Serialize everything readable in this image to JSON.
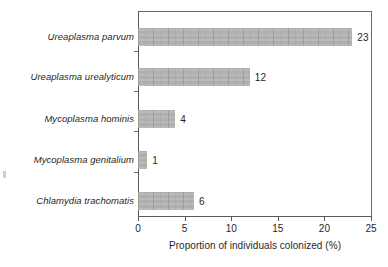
{
  "chart_data": {
    "type": "bar",
    "orientation": "horizontal",
    "title": "",
    "xlabel": "Proportion of individuals colonized (%)",
    "ylabel": "",
    "categories": [
      "Ureaplasma parvum",
      "Ureaplasma urealyticum",
      "Mycoplasma hominis",
      "Mycoplasma genitalium",
      "Chlamydia trachomatis"
    ],
    "values": [
      23,
      12,
      4,
      1,
      6
    ],
    "value_labels": [
      "23",
      "12",
      "4",
      "1",
      "6"
    ],
    "xlim": [
      0,
      25
    ],
    "xticks": [
      0,
      5,
      10,
      15,
      20,
      25
    ],
    "xtick_labels": [
      "0",
      "5",
      "10",
      "15",
      "20",
      "25"
    ],
    "grid": false,
    "legend": null,
    "bar_color": "#b2b2b2",
    "axis_color": "#5a5a5a",
    "text_color": "#1f1f1f"
  },
  "axis": {
    "x_title": "Proportion of individuals colonized (%)"
  }
}
